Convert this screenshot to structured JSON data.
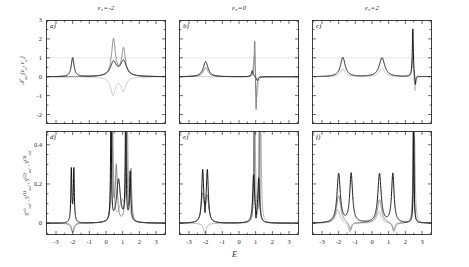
{
  "figure": {
    "xlabel": "E",
    "top_ylabel_html": "𝒯<sub>σσ'</sub>(ε<sub>σ</sub>, ε<sub>σ'</sub>)",
    "bottom_ylabel_html": "S<sup>ab</sup><sub>σσ'</sub> , S<sup>(1)</sup><sub>σσ'</sub> , S<sup>(2)</sup><sub>σσ'</sub> , S<sup>(3)</sup><sub>σσ'</sub>",
    "column_titles": [
      "ε₃=-2",
      "ε₃=0",
      "ε₃=2"
    ],
    "panel_labels": [
      "a)",
      "b)",
      "c)",
      "d)",
      "e)",
      "f)"
    ],
    "top_yticks": [
      "3",
      "2",
      "1",
      "0",
      "-1",
      "-2"
    ],
    "bottom_yticks": [
      "0.4",
      "0.2",
      "0"
    ],
    "xticks": [
      "-3",
      "-2",
      "-1",
      "0",
      "1",
      "2",
      "3"
    ],
    "colors": {
      "curve_black": "#111111",
      "curve_dark_gray": "#545454",
      "curve_mid_gray": "#8a8a8a",
      "curve_light_gray": "#b8b8b8",
      "axis": "#2b2b2b",
      "gridline": "#dcdcdc",
      "background": "#ffffff"
    }
  },
  "chart_data": {
    "type": "line",
    "title": "",
    "xlabel": "E",
    "ylabel": "",
    "xlim": [
      -3.6,
      3.6
    ],
    "grid": false,
    "legend": "none",
    "panels": [
      {
        "id": "a",
        "row": "top",
        "column_title": "ε₃=-2",
        "ylim": [
          -2.5,
          3.0
        ],
        "yticks": [
          3,
          2,
          1,
          0,
          -1,
          -2
        ],
        "gridline_y": 1,
        "series": [
          {
            "name": "curve-black",
            "color": "#111111",
            "peaks": [
              {
                "center": -2.0,
                "height": 1.0,
                "width": 0.1
              },
              {
                "center": 0.45,
                "height": 0.75,
                "width": 0.22
              },
              {
                "center": 1.05,
                "height": 0.8,
                "width": 0.22
              }
            ],
            "baseline": 0
          },
          {
            "name": "curve-dark-gray",
            "color": "#6b6b6b",
            "peaks": [
              {
                "center": 0.45,
                "height": 1.95,
                "width": 0.14
              },
              {
                "center": 1.05,
                "height": 1.45,
                "width": 0.14
              }
            ],
            "baseline": 0
          },
          {
            "name": "curve-light-gray",
            "color": "#b8b8b8",
            "peaks": [
              {
                "center": 0.42,
                "height": -0.95,
                "width": 0.17
              },
              {
                "center": 1.05,
                "height": -0.72,
                "width": 0.17
              }
            ],
            "baseline": 0
          }
        ]
      },
      {
        "id": "b",
        "row": "top",
        "column_title": "ε₃=0",
        "ylim": [
          -2.5,
          3.0
        ],
        "yticks": [
          3,
          2,
          1,
          0,
          -1,
          -2
        ],
        "gridline_y": 1,
        "series": [
          {
            "name": "curve-black",
            "color": "#111111",
            "peaks": [
              {
                "center": -2.0,
                "height": 0.8,
                "width": 0.17
              },
              {
                "center": 0.8,
                "height": 0.32,
                "width": 0.06
              },
              {
                "center": 1.1,
                "height": -0.22,
                "width": 0.06
              }
            ],
            "baseline": 0
          },
          {
            "name": "curve-dark-gray",
            "color": "#6b6b6b",
            "peaks": [
              {
                "center": -2.0,
                "height": 0.48,
                "width": 0.17
              },
              {
                "center": 0.95,
                "height": 2.55,
                "width": 0.045
              },
              {
                "center": 1.02,
                "height": -2.45,
                "width": 0.045
              }
            ],
            "baseline": 0
          },
          {
            "name": "curve-light-gray",
            "color": "#b8b8b8",
            "peaks": [
              {
                "center": 0.92,
                "height": 1.4,
                "width": 0.08
              },
              {
                "center": 1.06,
                "height": -1.4,
                "width": 0.08
              }
            ],
            "baseline": 0
          }
        ]
      },
      {
        "id": "c",
        "row": "top",
        "column_title": "ε₃=2",
        "ylim": [
          -2.5,
          3.0
        ],
        "yticks": [
          3,
          2,
          1,
          0,
          -1,
          -2
        ],
        "gridline_y": 1,
        "series": [
          {
            "name": "curve-black",
            "color": "#111111",
            "peaks": [
              {
                "center": -1.75,
                "height": 1.02,
                "width": 0.17
              },
              {
                "center": 0.6,
                "height": 1.0,
                "width": 0.2
              },
              {
                "center": 2.45,
                "height": 2.55,
                "width": 0.035
              },
              {
                "center": 2.6,
                "height": -0.55,
                "width": 0.035
              }
            ],
            "baseline": 0
          },
          {
            "name": "curve-light-gray",
            "color": "#b0b0b0",
            "peaks": [
              {
                "center": -1.75,
                "height": 0.42,
                "width": 0.17
              },
              {
                "center": 0.6,
                "height": 0.45,
                "width": 0.2
              },
              {
                "center": 2.43,
                "height": 1.0,
                "width": 0.05
              },
              {
                "center": 2.58,
                "height": -0.85,
                "width": 0.05
              }
            ],
            "baseline": 0
          }
        ]
      },
      {
        "id": "d",
        "row": "bottom",
        "column_title": "ε₃=-2",
        "ylim": [
          -0.06,
          0.47
        ],
        "yticks": [
          0.4,
          0.2,
          0
        ],
        "series": [
          {
            "name": "curve-black",
            "color": "#111111",
            "peaks": [
              {
                "center": -2.08,
                "height": 0.27,
                "width": 0.035
              },
              {
                "center": -1.93,
                "height": 0.27,
                "width": 0.035
              },
              {
                "center": 0.3,
                "height": 0.62,
                "width": 0.03
              },
              {
                "center": 0.75,
                "height": 0.22,
                "width": 0.14
              },
              {
                "center": 1.18,
                "height": 0.62,
                "width": 0.03
              },
              {
                "center": 1.45,
                "height": 0.25,
                "width": 0.045
              }
            ],
            "baseline": 0
          },
          {
            "name": "curve-dark-gray",
            "color": "#6b6b6b",
            "peaks": [
              {
                "center": -2.0,
                "height": -0.045,
                "width": 0.08
              },
              {
                "center": 0.35,
                "height": 0.55,
                "width": 0.05
              },
              {
                "center": 0.62,
                "height": 0.28,
                "width": 0.07
              },
              {
                "center": 1.22,
                "height": 0.55,
                "width": 0.05
              },
              {
                "center": 1.5,
                "height": 0.26,
                "width": 0.05
              }
            ],
            "baseline": 0
          },
          {
            "name": "curve-mid-gray",
            "color": "#9a9a9a",
            "peaks": [
              {
                "center": -2.0,
                "height": -0.05,
                "width": 0.12
              },
              {
                "center": 0.4,
                "height": 0.5,
                "width": 0.06
              },
              {
                "center": 0.95,
                "height": 0.1,
                "width": 0.18
              },
              {
                "center": 1.28,
                "height": 0.48,
                "width": 0.06
              }
            ],
            "baseline": 0
          }
        ]
      },
      {
        "id": "e",
        "row": "bottom",
        "column_title": "ε₃=0",
        "ylim": [
          -0.06,
          0.47
        ],
        "yticks": [
          0.4,
          0.2,
          0
        ],
        "series": [
          {
            "name": "curve-black",
            "color": "#111111",
            "peaks": [
              {
                "center": -2.18,
                "height": 0.26,
                "width": 0.07
              },
              {
                "center": -1.9,
                "height": 0.26,
                "width": 0.07
              },
              {
                "center": -2.04,
                "height": -0.05,
                "width": 0.02
              },
              {
                "center": 0.88,
                "height": 0.24,
                "width": 0.07
              },
              {
                "center": 1.18,
                "height": 0.22,
                "width": 0.06
              },
              {
                "center": 1.02,
                "height": -0.05,
                "width": 0.02
              }
            ],
            "baseline": 0
          },
          {
            "name": "curve-dark-gray",
            "color": "#6b6b6b",
            "peaks": [
              {
                "center": -2.18,
                "height": 0.14,
                "width": 0.1
              },
              {
                "center": -1.9,
                "height": 0.13,
                "width": 0.1
              },
              {
                "center": 0.9,
                "height": 0.62,
                "width": 0.03
              },
              {
                "center": 1.22,
                "height": 0.62,
                "width": 0.03
              }
            ],
            "baseline": 0
          },
          {
            "name": "curve-mid-gray",
            "color": "#9a9a9a",
            "peaks": [
              {
                "center": -2.04,
                "height": -0.055,
                "width": 0.1
              },
              {
                "center": 0.95,
                "height": 0.6,
                "width": 0.045
              },
              {
                "center": 1.3,
                "height": 0.58,
                "width": 0.045
              }
            ],
            "baseline": 0
          }
        ]
      },
      {
        "id": "f",
        "row": "bottom",
        "column_title": "ε₃=2",
        "ylim": [
          -0.06,
          0.47
        ],
        "yticks": [
          0.4,
          0.2,
          0
        ],
        "series": [
          {
            "name": "curve-black",
            "color": "#111111",
            "peaks": [
              {
                "center": -2.0,
                "height": 0.25,
                "width": 0.12
              },
              {
                "center": -1.25,
                "height": 0.25,
                "width": 0.1
              },
              {
                "center": 0.45,
                "height": 0.25,
                "width": 0.12
              },
              {
                "center": 1.25,
                "height": 0.25,
                "width": 0.09
              },
              {
                "center": 2.5,
                "height": 0.62,
                "width": 0.025
              }
            ],
            "baseline": 0
          },
          {
            "name": "curve-dark-gray",
            "color": "#6b6b6b",
            "peaks": [
              {
                "center": -2.0,
                "height": 0.14,
                "width": 0.15
              },
              {
                "center": -1.3,
                "height": -0.04,
                "width": 0.08
              },
              {
                "center": 0.45,
                "height": 0.12,
                "width": 0.15
              },
              {
                "center": 1.3,
                "height": -0.04,
                "width": 0.08
              },
              {
                "center": 2.48,
                "height": 0.6,
                "width": 0.035
              }
            ],
            "baseline": 0
          },
          {
            "name": "curve-mid-gray",
            "color": "#a5a5a5",
            "peaks": [
              {
                "center": -2.05,
                "height": 0.07,
                "width": 0.16
              },
              {
                "center": -1.32,
                "height": -0.05,
                "width": 0.1
              },
              {
                "center": 0.42,
                "height": 0.06,
                "width": 0.16
              },
              {
                "center": 1.32,
                "height": -0.05,
                "width": 0.1
              },
              {
                "center": 2.55,
                "height": 0.45,
                "width": 0.05
              }
            ],
            "baseline": 0
          }
        ]
      }
    ]
  }
}
